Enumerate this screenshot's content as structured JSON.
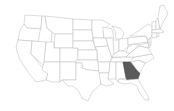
{
  "map": {
    "type": "US states choropleth",
    "highlighted_state": "Georgia",
    "colors": {
      "background": "#ffffff",
      "state_fill": "#ffffff",
      "state_border": "#b8b8b8",
      "highlight_fill": "#5a5a5a"
    }
  }
}
